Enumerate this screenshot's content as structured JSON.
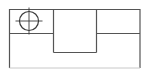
{
  "document": {
    "type": "technical-line-drawing",
    "title": "",
    "background_color": "#ffffff",
    "width": 151,
    "height": 78
  },
  "style": {
    "line_color": "#555555",
    "faint_line_color": "#c8c8c8",
    "circle_color": "#3a3a3a",
    "line_width": 1.2,
    "thin_line_width": 0.9
  },
  "geometry": {
    "outer_rect": {
      "name": "outer-boundary",
      "x": 9.5,
      "y": 9.5,
      "width": 130.5,
      "height": 58.5
    },
    "horizontal_divider": {
      "name": "horizontal-divider",
      "y": 33.5,
      "segments": [
        {
          "x1": 9.5,
          "x2": 53.5
        },
        {
          "x1": 96.5,
          "x2": 140.0
        }
      ]
    },
    "vertical_dividers": [
      {
        "name": "vertical-divider-left",
        "x": 53.5,
        "y1": 9.5,
        "y2": 52.5
      },
      {
        "name": "vertical-divider-right",
        "x": 96.5,
        "y1": 9.5,
        "y2": 52.5
      }
    ],
    "center_box_bottom": {
      "name": "center-box-bottom-edge",
      "y": 52.5,
      "x1": 53.5,
      "x2": 96.5
    },
    "bottom_edge": {
      "name": "outer-bottom-edge",
      "y": 68.0,
      "x1": 9.5,
      "x2": 140.0,
      "faint": true
    },
    "circle": {
      "name": "circle-with-center-mark",
      "cx": 29.0,
      "cy": 21.0,
      "r": 9.5,
      "crosshair_overhang": 4.0
    }
  },
  "labels": {
    "dimensions": [],
    "annotations": [],
    "text_items": []
  }
}
